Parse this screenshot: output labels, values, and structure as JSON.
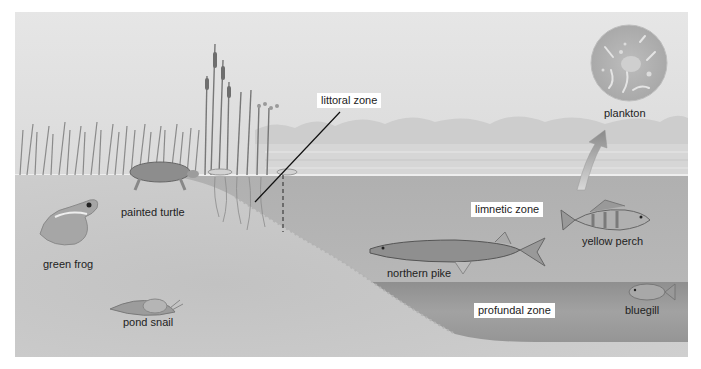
{
  "diagram": {
    "title": "",
    "zones": {
      "littoral": "littoral zone",
      "limnetic": "limnetic zone",
      "profundal": "profundal zone"
    },
    "organisms": {
      "plankton": "plankton",
      "painted_turtle": "painted turtle",
      "green_frog": "green frog",
      "pond_snail": "pond snail",
      "northern_pike": "northern pike",
      "yellow_perch": "yellow perch",
      "bluegill": "bluegill"
    },
    "colors": {
      "sky": "#e2e2e2",
      "water": "#b5b5b5",
      "profundal_water": "#9e9e9e",
      "sediment": "#c8c8c8",
      "label_bg": "#ffffff",
      "text": "#222222"
    }
  }
}
